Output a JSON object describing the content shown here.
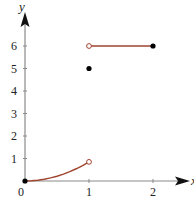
{
  "chart_data": {
    "type": "line",
    "title": "",
    "xlabel": "x",
    "ylabel": "y",
    "xlim": [
      0,
      2.4
    ],
    "ylim": [
      0,
      7
    ],
    "grid": false,
    "x_ticks": [
      {
        "value": 0,
        "label": "0"
      },
      {
        "value": 1,
        "label": "1"
      },
      {
        "value": 2,
        "label": "2"
      }
    ],
    "y_ticks": [
      {
        "value": 1,
        "label": "1"
      },
      {
        "value": 2,
        "label": "2"
      },
      {
        "value": 3,
        "label": "3"
      },
      {
        "value": 4,
        "label": "4"
      },
      {
        "value": 5,
        "label": "5"
      },
      {
        "value": 6,
        "label": "6"
      }
    ],
    "origin_label": "0",
    "series": [
      {
        "name": "piece-curve",
        "kind": "curve",
        "x": [
          0,
          0.1,
          0.2,
          0.3,
          0.4,
          0.5,
          0.6,
          0.7,
          0.8,
          0.9,
          1.0
        ],
        "y": [
          0,
          0.0085,
          0.034,
          0.0765,
          0.136,
          0.2125,
          0.306,
          0.4165,
          0.544,
          0.6885,
          0.85
        ]
      },
      {
        "name": "piece-constant",
        "kind": "segment",
        "x": [
          1,
          2
        ],
        "y": [
          6,
          6
        ]
      }
    ],
    "points": [
      {
        "name": "start-point",
        "x": 0,
        "y": 0,
        "style": "filled"
      },
      {
        "name": "curve-end-open",
        "x": 1,
        "y": 0.85,
        "style": "open"
      },
      {
        "name": "isolated-point",
        "x": 1,
        "y": 5,
        "style": "filled"
      },
      {
        "name": "segment-start-open",
        "x": 1,
        "y": 6,
        "style": "open"
      },
      {
        "name": "segment-end-point",
        "x": 2,
        "y": 6,
        "style": "filled"
      }
    ],
    "colors": {
      "curve": "#a0432e",
      "axis": "#8a8a8a",
      "points": "#000000"
    }
  }
}
